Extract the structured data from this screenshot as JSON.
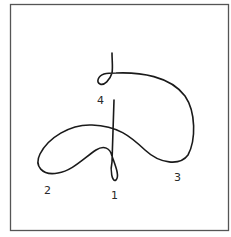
{
  "diagram": {
    "type": "continuous-curve-path",
    "frame": {
      "stroke": "#555555"
    },
    "curve": {
      "stroke": "#1a1a1a"
    },
    "labels": [
      {
        "id": "1",
        "text": "1"
      },
      {
        "id": "2",
        "text": "2"
      },
      {
        "id": "3",
        "text": "3"
      },
      {
        "id": "4",
        "text": "4"
      }
    ]
  }
}
